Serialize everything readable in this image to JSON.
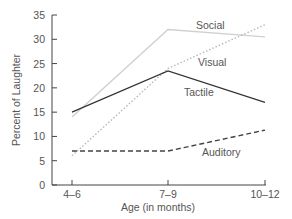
{
  "chart_data": {
    "type": "line",
    "title": "",
    "xlabel": "Age (in months)",
    "ylabel": "Percent of Laughter",
    "categories": [
      "4–6",
      "7–9",
      "10–12"
    ],
    "ylim": [
      0,
      35
    ],
    "yticks": [
      0,
      5,
      10,
      15,
      20,
      25,
      30,
      35
    ],
    "grid": false,
    "legend_position": "inline labels",
    "series": [
      {
        "name": "Social",
        "values": [
          14,
          32,
          30.5
        ],
        "style": "solid",
        "color": "#d0d0d0"
      },
      {
        "name": "Visual",
        "values": [
          6,
          24,
          33
        ],
        "style": "dotted",
        "color": "#b8b8b8"
      },
      {
        "name": "Tactile",
        "values": [
          15,
          23.5,
          17
        ],
        "style": "solid",
        "color": "#333333"
      },
      {
        "name": "Auditory",
        "values": [
          7,
          7,
          11.3
        ],
        "style": "dashed",
        "color": "#444444"
      }
    ]
  }
}
